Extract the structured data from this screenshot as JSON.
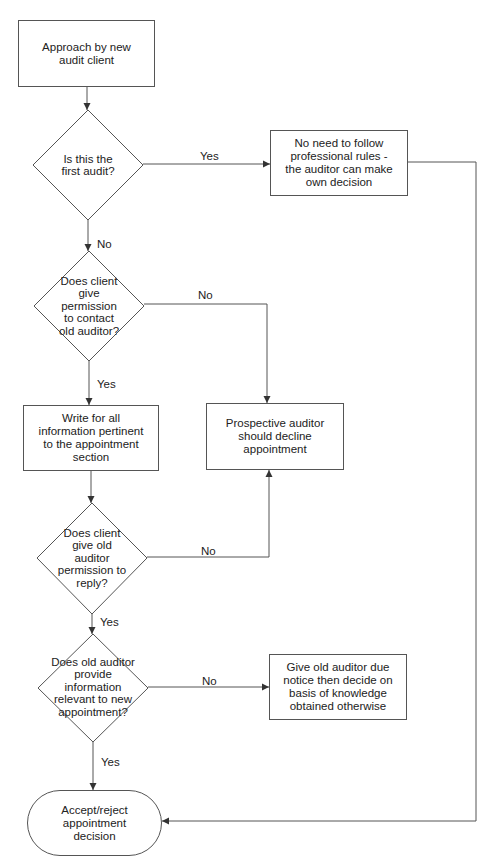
{
  "diagram": {
    "type": "flowchart",
    "nodes": {
      "start": {
        "label": "Approach by new audit client",
        "shape": "rectangle"
      },
      "first_audit": {
        "label": "Is this the first audit?",
        "shape": "decision"
      },
      "no_rules": {
        "label": "No need to follow professional rules - the auditor can make own decision",
        "shape": "rectangle"
      },
      "permission_contact": {
        "label": "Does client give permission to contact old auditor?",
        "shape": "decision"
      },
      "write_info": {
        "label": "Write for all information pertinent to the appointment section",
        "shape": "rectangle"
      },
      "decline": {
        "label": "Prospective auditor should decline appointment",
        "shape": "rectangle"
      },
      "permission_reply": {
        "label": "Does client give old auditor permission to reply?",
        "shape": "decision"
      },
      "provide_info": {
        "label": "Does old auditor provide information relevant to new appointment?",
        "shape": "decision"
      },
      "give_notice": {
        "label": "Give old auditor due notice then decide on basis of knowledge obtained otherwise",
        "shape": "rectangle"
      },
      "end": {
        "label": "Accept/reject appointment decision",
        "shape": "terminal"
      }
    },
    "edge_labels": {
      "first_audit_yes": "Yes",
      "first_audit_no": "No",
      "permission_contact_no": "No",
      "permission_contact_yes": "Yes",
      "permission_reply_no": "No",
      "permission_reply_yes": "Yes",
      "provide_info_no": "No",
      "provide_info_yes": "Yes"
    },
    "edges": [
      {
        "from": "start",
        "to": "first_audit"
      },
      {
        "from": "first_audit",
        "to": "no_rules",
        "label": "Yes"
      },
      {
        "from": "first_audit",
        "to": "permission_contact",
        "label": "No"
      },
      {
        "from": "permission_contact",
        "to": "decline",
        "label": "No"
      },
      {
        "from": "permission_contact",
        "to": "write_info",
        "label": "Yes"
      },
      {
        "from": "write_info",
        "to": "permission_reply"
      },
      {
        "from": "permission_reply",
        "to": "decline",
        "label": "No"
      },
      {
        "from": "permission_reply",
        "to": "provide_info",
        "label": "Yes"
      },
      {
        "from": "provide_info",
        "to": "give_notice",
        "label": "No"
      },
      {
        "from": "provide_info",
        "to": "end",
        "label": "Yes"
      },
      {
        "from": "no_rules",
        "to": "end"
      }
    ],
    "colors": {
      "line": "#555555",
      "text": "#222222",
      "background": "#ffffff"
    }
  }
}
